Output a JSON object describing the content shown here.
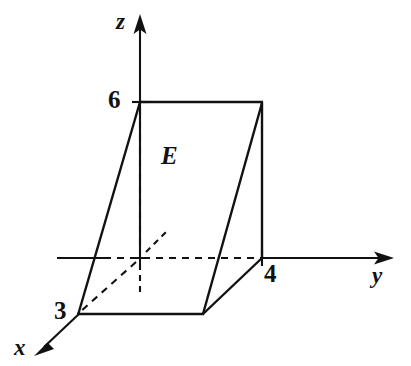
{
  "figure": {
    "type": "3d-solid-region-diagram",
    "region_label": "E",
    "background_color": "#ffffff",
    "ink_color": "#111111"
  },
  "axes": [
    {
      "id": "z",
      "name": "z",
      "label": "z",
      "direction": "up",
      "arrow_tip": [
        140,
        16
      ],
      "origin": [
        140,
        258
      ]
    },
    {
      "id": "y",
      "name": "y",
      "label": "y",
      "direction": "right",
      "arrow_tip": [
        392,
        258
      ],
      "origin": [
        140,
        258
      ]
    },
    {
      "id": "x",
      "name": "x",
      "label": "x",
      "direction": "down-left",
      "arrow_tip": [
        35,
        354
      ],
      "origin": [
        140,
        258
      ]
    }
  ],
  "tick_labels": [
    {
      "id": "z-tick-6",
      "axis": "z",
      "value": "6",
      "position": [
        140,
        102
      ]
    },
    {
      "id": "y-tick-4",
      "axis": "y",
      "value": "4",
      "position": [
        262,
        258
      ]
    },
    {
      "id": "x-tick-3",
      "axis": "x",
      "value": "3",
      "position": [
        78,
        314
      ]
    }
  ],
  "vertices": {
    "z6": [
      140,
      102
    ],
    "top_right": [
      262,
      102
    ],
    "y4": [
      262,
      258
    ],
    "bottom_mid": [
      203,
      314
    ],
    "x3": [
      78,
      314
    ],
    "origin": [
      140,
      258
    ]
  },
  "solid_edges": [
    {
      "name": "top-edge",
      "from": [
        140,
        102
      ],
      "to": [
        262,
        102
      ]
    },
    {
      "name": "right-vertical-edge",
      "from": [
        262,
        102
      ],
      "to": [
        262,
        258
      ]
    },
    {
      "name": "right-slant-edge",
      "from": [
        262,
        102
      ],
      "to": [
        203,
        314
      ]
    },
    {
      "name": "front-right-edge",
      "from": [
        262,
        258
      ],
      "to": [
        203,
        314
      ]
    },
    {
      "name": "bottom-front-edge",
      "from": [
        203,
        314
      ],
      "to": [
        78,
        314
      ]
    },
    {
      "name": "left-slant-edge",
      "from": [
        78,
        314
      ],
      "to": [
        140,
        102
      ]
    }
  ],
  "hidden_edges": [
    {
      "name": "hidden-vertical-z-edge",
      "from": [
        140,
        102
      ],
      "to": [
        140,
        258
      ]
    },
    {
      "name": "hidden-x-axis-to-3",
      "from": [
        140,
        258
      ],
      "to": [
        78,
        314
      ]
    },
    {
      "name": "hidden-y-axis-segment",
      "from": [
        104,
        258
      ],
      "to": [
        262,
        258
      ]
    },
    {
      "name": "hidden-neg-x-stub",
      "from": [
        145,
        253
      ],
      "to": [
        168,
        230
      ]
    },
    {
      "name": "hidden-neg-z-stub",
      "from": [
        140,
        263
      ],
      "to": [
        140,
        290
      ]
    }
  ]
}
